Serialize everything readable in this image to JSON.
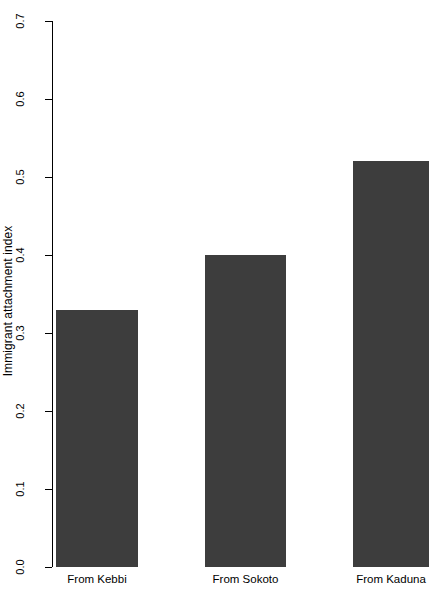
{
  "chart_data": {
    "type": "bar",
    "title": "",
    "subtitle": "",
    "xlabel": "",
    "ylabel": "Immigrant attachment index",
    "categories": [
      "From Kebbi",
      "From Sokoto",
      "From Kaduna"
    ],
    "values": [
      0.33,
      0.4,
      0.52
    ],
    "ylim": [
      0.0,
      0.7
    ],
    "ytick_labels": [
      "0.0",
      "0.1",
      "0.2",
      "0.3",
      "0.4",
      "0.5",
      "0.6",
      "0.7"
    ],
    "ytick_values": [
      0.0,
      0.1,
      0.2,
      0.3,
      0.4,
      0.5,
      0.6,
      0.7
    ],
    "grid": false,
    "legend": false,
    "legend_position": "none",
    "bar_color": "#3d3d3d",
    "axis_color": "#000000",
    "background_color": "#ffffff",
    "annotations": []
  },
  "axis": {
    "y_title": "Immigrant attachment index"
  }
}
